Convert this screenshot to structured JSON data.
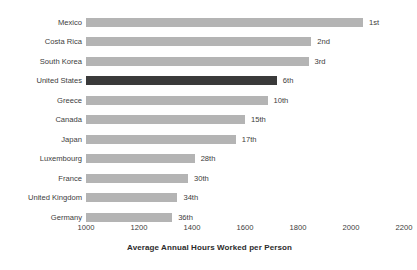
{
  "chart_data": {
    "type": "bar",
    "orientation": "horizontal",
    "title": "",
    "subtitle": "",
    "xlabel": "Average Annual Hours Worked per Person",
    "ylabel": "",
    "xlim": [
      1000,
      2200
    ],
    "xticks": [
      1000,
      1200,
      1400,
      1600,
      1800,
      2000,
      2200
    ],
    "xtick_labels": [
      "1000",
      "1200",
      "1400",
      "1600",
      "1800",
      "2000",
      "2200"
    ],
    "grid": false,
    "legend": null,
    "categories": [
      "Mexico",
      "Costa Rica",
      "South Korea",
      "United States",
      "Greece",
      "Canada",
      "Japan",
      "Luxembourg",
      "France",
      "United Kingdom",
      "Germany"
    ],
    "values": [
      2045,
      1850,
      1840,
      1720,
      1685,
      1600,
      1565,
      1410,
      1385,
      1345,
      1325
    ],
    "annotations": [
      "1st",
      "2nd",
      "3rd",
      "6th",
      "10th",
      "15th",
      "17th",
      "28th",
      "30th",
      "34th",
      "36th"
    ],
    "highlight_index": 3,
    "colors": {
      "bar": "#b4b4b4",
      "bar_highlight": "#3a3a3a",
      "text": "#3c3c3c",
      "axis_title": "#2b2b2b",
      "background": "#ffffff"
    },
    "bars": [
      {
        "category": "Mexico",
        "value": 2045,
        "rank": "1st"
      },
      {
        "category": "Costa Rica",
        "value": 1850,
        "rank": "2nd"
      },
      {
        "category": "South Korea",
        "value": 1840,
        "rank": "3rd"
      },
      {
        "category": "United States",
        "value": 1720,
        "rank": "6th"
      },
      {
        "category": "Greece",
        "value": 1685,
        "rank": "10th"
      },
      {
        "category": "Canada",
        "value": 1600,
        "rank": "15th"
      },
      {
        "category": "Japan",
        "value": 1565,
        "rank": "17th"
      },
      {
        "category": "Luxembourg",
        "value": 1410,
        "rank": "28th"
      },
      {
        "category": "France",
        "value": 1385,
        "rank": "30th"
      },
      {
        "category": "United Kingdom",
        "value": 1345,
        "rank": "34th"
      },
      {
        "category": "Germany",
        "value": 1325,
        "rank": "36th"
      }
    ]
  }
}
